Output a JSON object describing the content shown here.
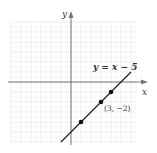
{
  "chart_data": {
    "type": "line",
    "title": "",
    "xlabel": "x",
    "ylabel": "y",
    "grid": true,
    "xlim": [
      -6,
      6.5
    ],
    "ylim": [
      -6,
      6
    ],
    "series": [
      {
        "name": "y = x − 5",
        "equation": "y = x - 5",
        "x": [
          -1,
          6
        ],
        "y": [
          -6,
          1
        ]
      }
    ],
    "points": [
      {
        "x": 1,
        "y": -4,
        "label": ""
      },
      {
        "x": 3,
        "y": -2,
        "label": "(3, −2)"
      },
      {
        "x": 4,
        "y": -1,
        "label": ""
      }
    ],
    "annotations": [
      {
        "text": "y = x − 5",
        "near": "upper end of line"
      },
      {
        "text": "(3, −2)",
        "near": "point (3,-2)"
      }
    ]
  },
  "labels": {
    "x_axis": "x",
    "y_axis": "y",
    "equation": "y = x − 5",
    "point": "(3, −2)"
  },
  "colors": {
    "grid": "#e6e6e6",
    "axis": "#555555",
    "line": "#222222",
    "point": "#111111"
  }
}
